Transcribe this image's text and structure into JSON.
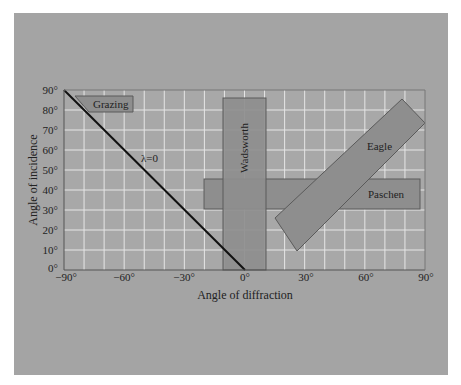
{
  "chart_data": {
    "type": "diagram",
    "title": "",
    "xlabel": "Angle of diffraction",
    "ylabel": "Angle of incidence",
    "xlim": [
      -90,
      90
    ],
    "ylim": [
      0,
      90
    ],
    "grid": true,
    "grid_step_deg": 10,
    "x_ticks": [
      "−90°",
      "−60°",
      "−30°",
      "0°",
      "30°",
      "60°",
      "90°"
    ],
    "y_ticks": [
      "0°",
      "10°",
      "20°",
      "30°",
      "40°",
      "50°",
      "60°",
      "70°",
      "80°",
      "90°"
    ],
    "line": {
      "label": "λ=0",
      "from": [
        -90,
        90
      ],
      "to": [
        0,
        0
      ]
    },
    "regions": [
      {
        "name": "Grazing",
        "x": [
          -85,
          -57
        ],
        "y": [
          79,
          87
        ]
      },
      {
        "name": "Wadsworth",
        "x": [
          -10,
          11
        ],
        "y": [
          0,
          86
        ]
      },
      {
        "name": "Paschen",
        "x": [
          -20,
          88
        ],
        "y": [
          30,
          46
        ]
      },
      {
        "name": "Eagle",
        "corners": [
          [
            15,
            26
          ],
          [
            27,
            10
          ],
          [
            90,
            73
          ],
          [
            79,
            85
          ]
        ]
      }
    ]
  },
  "labels": {
    "xlabel": "Angle of diffraction",
    "ylabel": "Angle of incidence",
    "lambda": "λ=0",
    "grazing": "Grazing",
    "wadsworth": "Wadsworth",
    "paschen": "Paschen",
    "eagle": "Eagle",
    "xt0": "−90°",
    "xt1": "−60°",
    "xt2": "−30°",
    "xt3": "0°",
    "xt4": "30°",
    "xt5": "60°",
    "xt6": "90°",
    "yt0": "0°",
    "yt1": "10°",
    "yt2": "20°",
    "yt3": "30°",
    "yt4": "40°",
    "yt5": "50°",
    "yt6": "60°",
    "yt7": "70°",
    "yt8": "80°",
    "yt9": "90°"
  },
  "colors": {
    "panel": "#a4a4a4",
    "plot_bg": "#a8a8a8",
    "grid": "#e4e4e4",
    "region_fill": "#8d8d8d",
    "region_stroke": "#555555",
    "line": "#111111"
  }
}
